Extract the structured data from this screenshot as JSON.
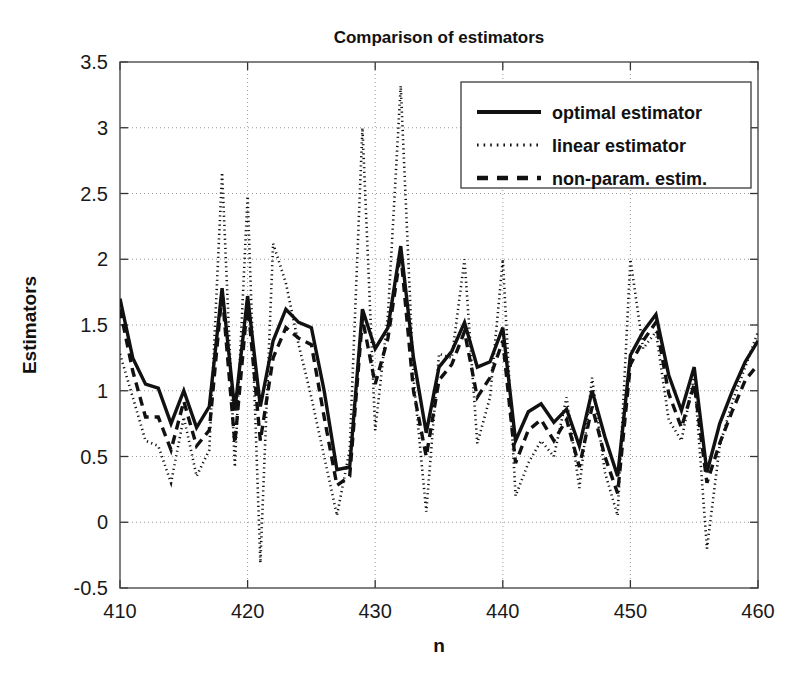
{
  "chart_data": {
    "type": "line",
    "title": "Comparison of estimators",
    "xlabel": "n",
    "ylabel": "Estimators",
    "xlim": [
      410,
      460
    ],
    "ylim": [
      -0.5,
      3.5
    ],
    "xticks": [
      410,
      420,
      430,
      440,
      450,
      460
    ],
    "yticks": [
      -0.5,
      0,
      0.5,
      1,
      1.5,
      2,
      2.5,
      3,
      3.5
    ],
    "xtick_labels": [
      "410",
      "420",
      "430",
      "440",
      "450",
      "460"
    ],
    "ytick_labels": [
      "-0.5",
      "0",
      "0.5",
      "1",
      "1.5",
      "2",
      "2.5",
      "3",
      "3.5"
    ],
    "grid": true,
    "legend_position": "top-right",
    "x": [
      410,
      411,
      412,
      413,
      414,
      415,
      416,
      417,
      418,
      419,
      420,
      421,
      422,
      423,
      424,
      425,
      426,
      427,
      428,
      429,
      430,
      431,
      432,
      433,
      434,
      435,
      436,
      437,
      438,
      439,
      440,
      441,
      442,
      443,
      444,
      445,
      446,
      447,
      448,
      449,
      450,
      451,
      452,
      453,
      454,
      455,
      456,
      457,
      458,
      459,
      460
    ],
    "series": [
      {
        "name": "optimal estimator",
        "style": "solid",
        "values": [
          1.7,
          1.25,
          1.05,
          1.02,
          0.75,
          1.0,
          0.72,
          0.88,
          1.78,
          0.85,
          1.72,
          0.88,
          1.38,
          1.62,
          1.52,
          1.48,
          1.0,
          0.4,
          0.42,
          1.62,
          1.32,
          1.48,
          2.1,
          1.25,
          0.68,
          1.18,
          1.3,
          1.52,
          1.18,
          1.22,
          1.48,
          0.62,
          0.84,
          0.9,
          0.76,
          0.86,
          0.58,
          1.0,
          0.65,
          0.35,
          1.27,
          1.45,
          1.58,
          1.12,
          0.85,
          1.18,
          0.38,
          0.75,
          1.0,
          1.22,
          1.38
        ]
      },
      {
        "name": "linear estimator",
        "style": "dotted",
        "values": [
          1.28,
          0.95,
          0.62,
          0.58,
          0.3,
          0.8,
          0.35,
          0.55,
          2.66,
          0.42,
          2.48,
          -0.31,
          2.12,
          1.82,
          1.35,
          0.95,
          0.5,
          0.05,
          0.55,
          3.0,
          0.7,
          1.58,
          3.32,
          1.1,
          0.08,
          1.28,
          1.25,
          2.0,
          0.6,
          0.95,
          2.0,
          0.2,
          0.45,
          0.62,
          0.5,
          0.95,
          0.26,
          1.1,
          0.38,
          0.05,
          2.0,
          1.32,
          1.45,
          0.78,
          0.62,
          1.12,
          -0.2,
          0.58,
          0.92,
          1.18,
          1.45
        ]
      },
      {
        "name": "non-param. estim.",
        "style": "dashed",
        "values": [
          1.62,
          1.15,
          0.8,
          0.8,
          0.55,
          0.92,
          0.58,
          0.7,
          1.75,
          0.6,
          1.68,
          0.62,
          1.25,
          1.48,
          1.4,
          1.35,
          0.8,
          0.28,
          0.35,
          1.55,
          1.05,
          1.4,
          2.05,
          1.0,
          0.5,
          1.08,
          1.2,
          1.45,
          0.95,
          1.1,
          1.38,
          0.45,
          0.7,
          0.78,
          0.62,
          0.78,
          0.42,
          0.88,
          0.5,
          0.22,
          1.2,
          1.38,
          1.52,
          0.98,
          0.72,
          1.05,
          0.3,
          0.6,
          0.85,
          1.08,
          1.2
        ]
      }
    ]
  },
  "legend": {
    "entries": [
      {
        "label": "optimal estimator",
        "style": "solid"
      },
      {
        "label": "linear estimator",
        "style": "dotted"
      },
      {
        "label": "non-param. estim.",
        "style": "dashed"
      }
    ]
  }
}
